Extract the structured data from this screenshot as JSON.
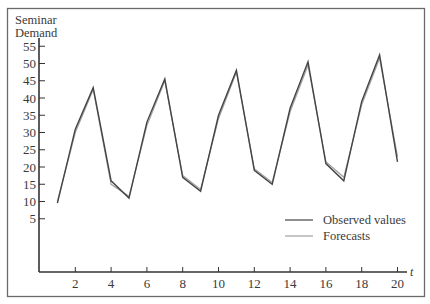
{
  "chart_data": {
    "type": "line",
    "title": "",
    "ylabel": "Seminar Demand",
    "ylabel_lines": [
      "Seminar",
      "Demand"
    ],
    "xlabel": "t",
    "x": [
      1,
      2,
      3,
      4,
      5,
      6,
      7,
      8,
      9,
      10,
      11,
      12,
      13,
      14,
      15,
      16,
      17,
      18,
      19,
      20
    ],
    "x_ticks": [
      2,
      4,
      6,
      8,
      10,
      12,
      14,
      16,
      18,
      20
    ],
    "y_ticks": [
      5,
      10,
      15,
      20,
      25,
      30,
      35,
      40,
      45,
      50,
      55
    ],
    "xlim": [
      0,
      20.5
    ],
    "ylim": [
      0,
      57
    ],
    "grid": false,
    "legend_position": "lower right",
    "series": [
      {
        "name": "Observed values",
        "color": "#444444",
        "values": [
          9.5,
          31,
          43,
          16,
          11,
          33,
          45.5,
          17,
          13,
          35,
          48,
          19,
          15,
          37,
          50.5,
          21,
          16,
          39,
          52.5,
          21.5
        ]
      },
      {
        "name": "Forecasts",
        "color": "#a0a0a0",
        "values": [
          10,
          30,
          42.5,
          15,
          11.5,
          32,
          45,
          17.5,
          13.5,
          34,
          47.5,
          19.5,
          15.5,
          36,
          49.5,
          21.5,
          17,
          38,
          51.5,
          23
        ]
      }
    ]
  },
  "legend": {
    "observed_label": "Observed values",
    "forecasts_label": "Forecasts"
  },
  "axis": {
    "y_title_line1": "Seminar",
    "y_title_line2": "Demand",
    "x_title": "t"
  }
}
